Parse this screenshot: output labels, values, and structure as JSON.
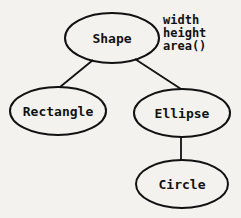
{
  "diagram": {
    "type": "class-hierarchy",
    "nodes": [
      {
        "id": "shape",
        "label": "Shape",
        "attributes": [
          "width",
          "height",
          "area()"
        ]
      },
      {
        "id": "rectangle",
        "label": "Rectangle"
      },
      {
        "id": "ellipse",
        "label": "Ellipse"
      },
      {
        "id": "circle",
        "label": "Circle"
      }
    ],
    "edges": [
      {
        "from": "shape",
        "to": "rectangle"
      },
      {
        "from": "shape",
        "to": "ellipse"
      },
      {
        "from": "ellipse",
        "to": "circle"
      }
    ]
  }
}
